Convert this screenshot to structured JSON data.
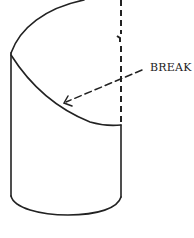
{
  "diagram": {
    "annotations": [
      {
        "id": "break",
        "text": "BREAK"
      }
    ],
    "colors": {
      "stroke": "#222222",
      "background": "#ffffff"
    }
  }
}
